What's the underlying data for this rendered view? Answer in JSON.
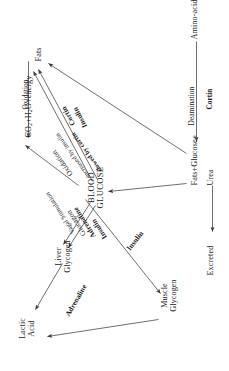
{
  "diagram": {
    "type": "metabolic-flow-diagram",
    "orientation": "page rotated 90 degrees counter-clockwise",
    "nodes": [
      {
        "id": "lactic_acid",
        "label_line1": "Lactic",
        "label_line2": "Acid"
      },
      {
        "id": "liver_glycogen",
        "label_line1": "Liver",
        "label_line2": "Glycogen"
      },
      {
        "id": "muscle_glycogen",
        "label_line1": "Muscle",
        "label_line2": "Glycogen"
      },
      {
        "id": "blood_glucose",
        "label_line1": "BLOOD",
        "label_line2": "GLUCOSE"
      },
      {
        "id": "co2",
        "label_line1": "CO2+H2O+energy",
        "label_line2": ""
      },
      {
        "id": "fats",
        "label_line1": "Fats",
        "label_line2": ""
      },
      {
        "id": "fats_glucose_urea",
        "label_line1": "Fats+Glucose+Urea",
        "label_line2": ""
      },
      {
        "id": "amino_acids",
        "label_line1": "Amino-acids",
        "label_line2": ""
      },
      {
        "id": "excreted",
        "label_line1": "Excreted",
        "label_line2": ""
      }
    ],
    "node_text": {
      "lactic_acid_1": "Lactic",
      "lactic_acid_2": "Acid",
      "liver_glycogen_1": "Liver",
      "liver_glycogen_2": "Glycogen",
      "muscle_glycogen_1": "Muscle",
      "muscle_glycogen_2": "Glycogen",
      "blood_glucose_1": "BLOOD",
      "blood_glucose_2": "GLUCOSE",
      "co2_pre": "CO",
      "co2_sub": "2",
      "co2_mid": "+H",
      "co2_sub2": "2",
      "co2_post": "O+energy",
      "fats": "Fats",
      "fats_glucose_urea_a": "Fats+Glucose+",
      "fats_glucose_urea_b": "Urea",
      "amino_acids": "Amino-acids",
      "excreted": "Excreted"
    },
    "edge_labels": {
      "adrenaline_lactic": "Adrenaline",
      "insulin_liver": "Insulin",
      "adrenaline_liver": "Adrenaline",
      "glucagon_liver": "Glucagon",
      "vagal_stimulation": "Vagal Stimulation",
      "insulin_muscle": "Insulin",
      "oxidation_main": "Oxidation",
      "oxidation_note1": "increased by insulin",
      "oxidation_note2": "slowed by cortin",
      "insulin_fats": "Insulin",
      "cortin_fats": "Cortin",
      "oxidation_fats": "Oxidation",
      "deamination": "Deamination",
      "cortin_deamination": "Cortin"
    },
    "colors": {
      "ink": "#1a1a1a",
      "paper": "#ffffff",
      "stroke": "#4a4a4a"
    }
  }
}
